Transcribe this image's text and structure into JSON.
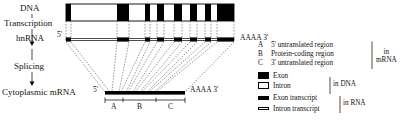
{
  "diagram": {
    "left_labels": {
      "dna": "DNA",
      "transcription": "Transcription",
      "hnrna": "hnRNA",
      "splicing": "Splicing",
      "mrna": "Cytoplasmic mRNA"
    },
    "end_labels": {
      "five_prime": "5'",
      "poly_a_hnrna": "AAAA 3'",
      "five_prime_mrna": "5'",
      "poly_a_mrna": "AAAA 3'"
    },
    "region_marks": [
      "A",
      "B",
      "C"
    ],
    "dna_track": {
      "x": 66,
      "y": 4,
      "width": 168,
      "height": 17,
      "exons": [
        {
          "x": 66,
          "width": 5
        },
        {
          "x": 117,
          "width": 12
        },
        {
          "x": 145,
          "width": 5
        },
        {
          "x": 157,
          "width": 7
        },
        {
          "x": 174,
          "width": 8
        },
        {
          "x": 190,
          "width": 7
        },
        {
          "x": 205,
          "width": 6
        },
        {
          "x": 217,
          "width": 17
        }
      ]
    },
    "hnrna_track": {
      "x": 66,
      "y": 38,
      "width": 168,
      "height": 3,
      "exon_transcripts": [
        {
          "x": 66,
          "width": 5
        },
        {
          "x": 117,
          "width": 12
        },
        {
          "x": 145,
          "width": 5
        },
        {
          "x": 157,
          "width": 7
        },
        {
          "x": 174,
          "width": 8
        },
        {
          "x": 190,
          "width": 7
        },
        {
          "x": 205,
          "width": 6
        },
        {
          "x": 217,
          "width": 17
        }
      ]
    },
    "mrna_track": {
      "x": 105,
      "y": 92,
      "width": 80,
      "height": 4
    },
    "region_brackets": {
      "y": 100,
      "segments": [
        {
          "label": "A",
          "x": 105,
          "width": 18
        },
        {
          "label": "B",
          "x": 123,
          "width": 33
        },
        {
          "label": "C",
          "x": 156,
          "width": 29
        }
      ]
    }
  },
  "legend": {
    "mrna_group": {
      "rows": [
        {
          "key": "A",
          "text": "5' untranslated region"
        },
        {
          "key": "B",
          "text": "Protein-coding region"
        },
        {
          "key": "C",
          "text": "3' untranslated region"
        }
      ],
      "group_label_line1": "in",
      "group_label_line2": "mRNA"
    },
    "dna_group": {
      "rows": [
        {
          "swatch": "exon-filled-square",
          "text": "Exon"
        },
        {
          "swatch": "intron-open-square",
          "text": "Intron"
        }
      ],
      "group_label": "in DNA"
    },
    "rna_group": {
      "rows": [
        {
          "swatch": "exon-transcript-bar",
          "text": "Exon transcript"
        },
        {
          "swatch": "intron-transcript-bar",
          "text": "Intron transcript"
        }
      ],
      "group_label": "in RNA"
    }
  },
  "colors": {
    "exon": "#000000",
    "intron": "#ffffff",
    "outline": "#000000",
    "background": "#ffffff"
  }
}
